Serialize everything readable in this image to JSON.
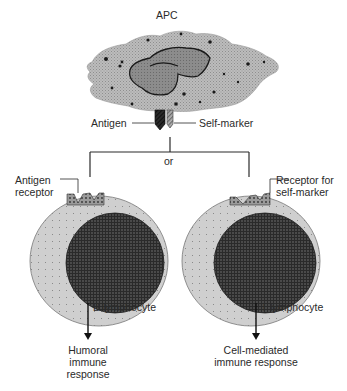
{
  "diagram": {
    "apc": {
      "label": "APC"
    },
    "antigen": {
      "label": "Antigen"
    },
    "self_marker": {
      "label": "Self-marker"
    },
    "connector": {
      "label": "or"
    },
    "b_cell": {
      "receptor_label_line1": "Antigen",
      "receptor_label_line2": "receptor",
      "cell_label": "B lymphocyte",
      "response_line1": "Humoral",
      "response_line2": "immune",
      "response_line3": "response"
    },
    "t_cell": {
      "receptor_label_line1": "Receptor for",
      "receptor_label_line2": "self-marker",
      "cell_label": "T lymphocyte",
      "response_line1": "Cell-mediated",
      "response_line2": "immune response"
    }
  },
  "colors": {
    "apc_fill": "#b9b9b9",
    "nucleus_fill": "#8a8a8a",
    "cytoplasm_fill": "#c8c8c8",
    "cell_nucleus": "#3a3a3a",
    "line": "#2a2a2a",
    "antigen": "#1e1e1e",
    "self_marker": "#9a9a9a"
  }
}
